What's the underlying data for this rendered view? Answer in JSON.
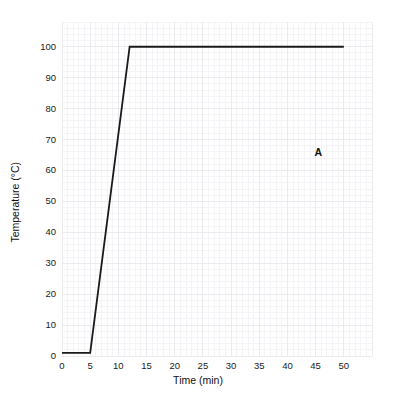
{
  "chart_data": {
    "type": "line",
    "title": "",
    "subtitle": "",
    "xlabel": "Time (min)",
    "ylabel": "Temperature (°C)",
    "xlim": [
      0,
      55
    ],
    "ylim": [
      0,
      108
    ],
    "grid": true,
    "grid_minor": true,
    "legend_position": "none",
    "xticks": [
      0,
      5,
      10,
      15,
      20,
      25,
      30,
      35,
      40,
      45,
      50
    ],
    "xtick_labels": [
      "0",
      "5",
      "10",
      "15",
      "20",
      "25",
      "30",
      "35",
      "40",
      "45",
      "50"
    ],
    "yticks": [
      0,
      10,
      20,
      30,
      40,
      50,
      60,
      70,
      80,
      90,
      100
    ],
    "ytick_labels": [
      "0",
      "10",
      "20",
      "30",
      "40",
      "50",
      "60",
      "70",
      "80",
      "90",
      "100"
    ],
    "series": [
      {
        "name": "A",
        "color": "#1a1a1a",
        "line_width": 1.8,
        "x": [
          0,
          5,
          12,
          50
        ],
        "y": [
          1,
          1,
          100,
          100
        ]
      }
    ],
    "annotations": [
      {
        "text": "A",
        "x": 45.5,
        "y": 66,
        "color": "#111111"
      }
    ]
  },
  "axes": {
    "x_title": "Time (min)",
    "y_title": "Temperature (°C)"
  },
  "style": {
    "background": "#ffffff",
    "grid_minor_color": "#f4f4f6",
    "grid_major_color": "#ebebef",
    "line_color": "#1a1a1a",
    "text_color": "#1a1a1a"
  }
}
